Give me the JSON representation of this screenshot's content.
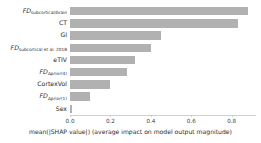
{
  "chart_data": {
    "type": "bar",
    "orientation": "horizontal",
    "title": "",
    "xlabel": "mean(|SHAP value|) (average impact on model output magnitude)",
    "ylabel": "",
    "xlim": [
      0,
      0.92
    ],
    "xticks": [
      "0.0",
      "0.2",
      "0.4",
      "0.6",
      "0.8"
    ],
    "xtick_values": [
      0.0,
      0.2,
      0.4,
      0.6,
      0.8
    ],
    "grid": false,
    "legend": false,
    "bar_color": "#b1b1b1",
    "categories": [
      "FDsubcortical/brain",
      "CT",
      "GI",
      "FDsubcortical et al. 2018",
      "eTIV",
      "FDΔprior(4)",
      "CortexVol",
      "FDΔprior(1)",
      "Sex"
    ],
    "category_labels": [
      {
        "base": "FD",
        "sub": "subcortical/brain",
        "italic": true
      },
      {
        "base": "CT",
        "sub": "",
        "italic": false
      },
      {
        "base": "GI",
        "sub": "",
        "italic": false
      },
      {
        "base": "FD",
        "sub": "subcortical et al. 2018",
        "italic": true
      },
      {
        "base": "eTIV",
        "sub": "",
        "italic": false
      },
      {
        "base": "FD",
        "sub": "Δprior(4)",
        "italic": true
      },
      {
        "base": "CortexVol",
        "sub": "",
        "italic": false
      },
      {
        "base": "FD",
        "sub": "Δprior(1)",
        "italic": true
      },
      {
        "base": "Sex",
        "sub": "",
        "italic": false
      }
    ],
    "values": [
      0.88,
      0.83,
      0.45,
      0.4,
      0.32,
      0.28,
      0.2,
      0.1,
      0.01
    ]
  }
}
